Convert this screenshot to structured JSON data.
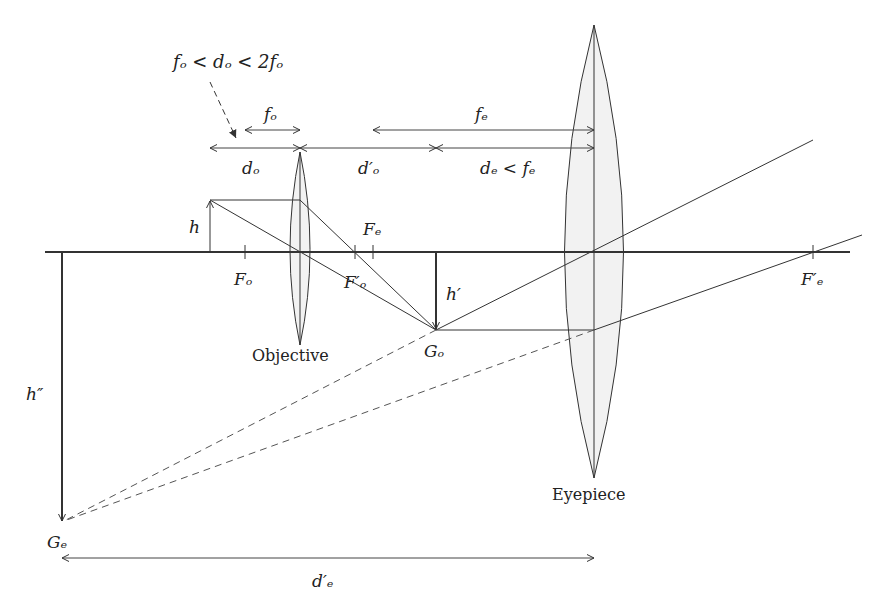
{
  "diagram": {
    "colors": {
      "line": "#333333",
      "lens_fill": "#f2f2f2",
      "text": "#222222"
    },
    "annotation": {
      "condition": "fₒ < dₒ < 2fₒ"
    },
    "dimensions": {
      "f_o": "fₒ",
      "d_o": "dₒ",
      "d_o_prime": "d′ₒ",
      "f_e": "fₑ",
      "d_e_condition": "dₑ < fₑ",
      "d_e_prime": "d′ₑ"
    },
    "heights": {
      "h": "h",
      "h_prime": "h′",
      "h_double_prime": "h″"
    },
    "focal_points": {
      "F_o": "Fₒ",
      "F_o_prime": "F′ₒ",
      "F_e": "Fₑ",
      "F_e_prime": "F′ₑ"
    },
    "image_points": {
      "G_o": "Gₒ",
      "G_e": "Gₑ"
    },
    "lenses": {
      "objective": "Objective",
      "eyepiece": "Eyepiece"
    }
  }
}
